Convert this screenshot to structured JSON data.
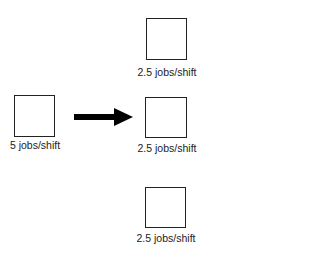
{
  "diagram": {
    "source": {
      "label": "5 jobs/shift"
    },
    "arrow": {
      "direction": "right",
      "color": "#000000"
    },
    "targets": [
      {
        "label": "2.5 jobs/shift"
      },
      {
        "label": "2.5 jobs/shift"
      },
      {
        "label": "2.5 jobs/shift"
      }
    ]
  }
}
